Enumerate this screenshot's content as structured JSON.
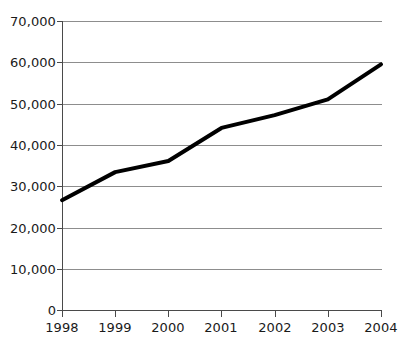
{
  "chart_data": {
    "type": "line",
    "title": "",
    "subtitle": "",
    "xlabel": "",
    "ylabel": "",
    "categories": [
      "1998",
      "1999",
      "2000",
      "2001",
      "2002",
      "2003",
      "2004"
    ],
    "x": [
      1998,
      1999,
      2000,
      2001,
      2002,
      2003,
      2004
    ],
    "series": [
      {
        "name": "",
        "values": [
          26600,
          33400,
          36100,
          44100,
          47200,
          51000,
          59500
        ],
        "color": "#000000",
        "line_width": 4
      }
    ],
    "values": [
      26600,
      33400,
      36100,
      44100,
      47200,
      51000,
      59500
    ],
    "ylim": [
      0,
      70000
    ],
    "ytick_values": [
      0,
      10000,
      20000,
      30000,
      40000,
      50000,
      60000,
      70000
    ],
    "ytick_labels": [
      "0",
      "10,000",
      "20,000",
      "30,000",
      "40,000",
      "50,000",
      "60,000",
      "70,000"
    ],
    "xtick_labels": [
      "1998",
      "1999",
      "2000",
      "2001",
      "2002",
      "2003",
      "2004"
    ],
    "grid": "horizontal",
    "grid_color": "#8d8d8d",
    "axis_color": "#4a4a4a",
    "legend": "none",
    "legend_position": "none",
    "background": "#ffffff",
    "annotations": []
  },
  "axes": {
    "y": {
      "labels": [
        {
          "text": "70,000",
          "value": 70000
        },
        {
          "text": "60,000",
          "value": 60000
        },
        {
          "text": "50,000",
          "value": 50000
        },
        {
          "text": "40,000",
          "value": 40000
        },
        {
          "text": "30,000",
          "value": 30000
        },
        {
          "text": "20,000",
          "value": 20000
        },
        {
          "text": "10,000",
          "value": 10000
        },
        {
          "text": "0",
          "value": 0
        }
      ]
    },
    "x": {
      "labels": [
        {
          "text": "1998"
        },
        {
          "text": "1999"
        },
        {
          "text": "2000"
        },
        {
          "text": "2001"
        },
        {
          "text": "2002"
        },
        {
          "text": "2003"
        },
        {
          "text": "2004"
        }
      ]
    }
  }
}
